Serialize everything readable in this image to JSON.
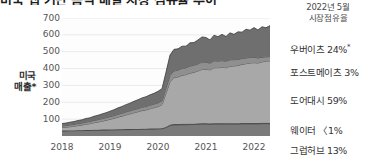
{
  "title": "미국 앱 기반 음식 배달 시장 점유율 추이",
  "axis": {
    "y_title": "미국\n매출*",
    "y_title_line1": "미국",
    "y_title_line2": "매출*",
    "yticks": [
      700,
      600,
      500,
      400,
      300,
      200,
      100
    ],
    "xticks": [
      "2018",
      "2019",
      "2020",
      "2021",
      "2022"
    ]
  },
  "legend": {
    "header_line1": "2022년 5월",
    "header_line2": "시장점유율",
    "items": [
      {
        "label": "우버이츠",
        "share": "24%",
        "star": "*",
        "color": "#6f6f6f"
      },
      {
        "label": "포스트메이츠",
        "share": "3%",
        "star": "",
        "color": "#8f8f8f"
      },
      {
        "label": "도어대시",
        "share": "59%",
        "star": "",
        "color": "#a8a8a8"
      },
      {
        "label": "웨이터",
        "share": "〈1%",
        "star": "",
        "color": "#555555"
      },
      {
        "label": "그럽허브",
        "share": "13%",
        "star": "",
        "color": "#7a7a7a"
      }
    ]
  },
  "chart_data": {
    "type": "area",
    "stacked": true,
    "title": "미국 앱 기반 음식 배달 시장 점유율 추이",
    "xlabel": "",
    "ylabel": "미국 매출*",
    "ylim": [
      0,
      700
    ],
    "xlim": [
      "2018-01",
      "2022-05"
    ],
    "grid": true,
    "legend_position": "right",
    "x": [
      "2018-01",
      "2018-02",
      "2018-03",
      "2018-04",
      "2018-05",
      "2018-06",
      "2018-07",
      "2018-08",
      "2018-09",
      "2018-10",
      "2018-11",
      "2018-12",
      "2019-01",
      "2019-02",
      "2019-03",
      "2019-04",
      "2019-05",
      "2019-06",
      "2019-07",
      "2019-08",
      "2019-09",
      "2019-10",
      "2019-11",
      "2019-12",
      "2020-01",
      "2020-02",
      "2020-03",
      "2020-04",
      "2020-05",
      "2020-06",
      "2020-07",
      "2020-08",
      "2020-09",
      "2020-10",
      "2020-11",
      "2020-12",
      "2021-01",
      "2021-02",
      "2021-03",
      "2021-04",
      "2021-05",
      "2021-06",
      "2021-07",
      "2021-08",
      "2021-09",
      "2021-10",
      "2021-11",
      "2021-12",
      "2022-01",
      "2022-02",
      "2022-03",
      "2022-04",
      "2022-05"
    ],
    "series": [
      {
        "name": "그럽허브",
        "color": "#7a7a7a",
        "order": 1,
        "values": [
          30,
          30,
          31,
          31,
          32,
          32,
          33,
          33,
          34,
          34,
          35,
          35,
          36,
          36,
          37,
          37,
          38,
          38,
          39,
          39,
          40,
          40,
          41,
          41,
          42,
          43,
          50,
          62,
          66,
          66,
          67,
          67,
          68,
          68,
          69,
          70,
          70,
          69,
          70,
          70,
          70,
          70,
          71,
          71,
          71,
          72,
          72,
          72,
          72,
          72,
          73,
          73,
          73
        ]
      },
      {
        "name": "웨이터",
        "color": "#555555",
        "order": 2,
        "values": [
          2,
          2,
          2,
          2,
          2,
          2,
          2,
          2,
          3,
          3,
          3,
          3,
          3,
          3,
          3,
          3,
          3,
          3,
          3,
          3,
          3,
          3,
          3,
          3,
          3,
          3,
          4,
          5,
          5,
          5,
          5,
          5,
          5,
          5,
          5,
          5,
          5,
          5,
          5,
          5,
          5,
          5,
          5,
          5,
          5,
          5,
          5,
          5,
          5,
          5,
          5,
          5,
          5
        ]
      },
      {
        "name": "도어대시",
        "color": "#a8a8a8",
        "order": 3,
        "values": [
          18,
          20,
          22,
          25,
          28,
          31,
          35,
          38,
          42,
          46,
          50,
          55,
          60,
          66,
          72,
          78,
          84,
          90,
          96,
          102,
          108,
          112,
          118,
          124,
          130,
          140,
          200,
          255,
          275,
          280,
          288,
          292,
          300,
          305,
          312,
          320,
          322,
          318,
          330,
          330,
          332,
          330,
          338,
          340,
          342,
          348,
          352,
          356,
          358,
          356,
          362,
          366,
          368
        ]
      },
      {
        "name": "포스트메이츠",
        "color": "#8f8f8f",
        "order": 4,
        "values": [
          10,
          10,
          11,
          11,
          12,
          12,
          13,
          13,
          14,
          14,
          15,
          15,
          16,
          16,
          17,
          17,
          18,
          18,
          19,
          19,
          20,
          20,
          21,
          21,
          22,
          23,
          30,
          38,
          40,
          40,
          41,
          41,
          42,
          42,
          42,
          43,
          42,
          40,
          41,
          40,
          40,
          39,
          38,
          37,
          36,
          35,
          34,
          33,
          32,
          30,
          28,
          26,
          25
        ]
      },
      {
        "name": "우버이츠",
        "color": "#6f6f6f",
        "order": 5,
        "values": [
          14,
          15,
          16,
          17,
          18,
          19,
          21,
          22,
          24,
          26,
          28,
          30,
          32,
          35,
          38,
          40,
          43,
          46,
          49,
          52,
          55,
          58,
          61,
          64,
          68,
          72,
          95,
          120,
          128,
          126,
          132,
          128,
          138,
          134,
          142,
          150,
          145,
          138,
          152,
          144,
          156,
          146,
          160,
          150,
          164,
          156,
          170,
          162,
          176,
          166,
          180,
          172,
          184
        ]
      }
    ]
  }
}
